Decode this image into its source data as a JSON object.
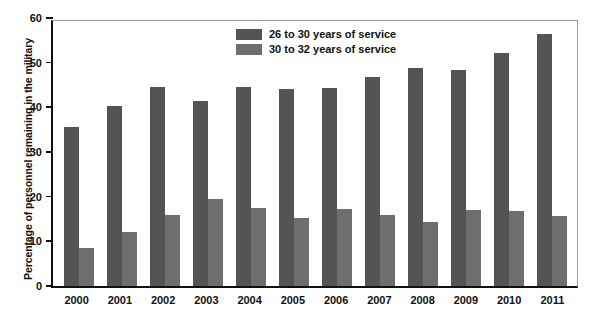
{
  "chart_data": {
    "type": "bar",
    "title": "",
    "xlabel": "",
    "ylabel": "Percentage of personnel remaining in the military",
    "ylim": [
      0,
      60
    ],
    "yticks": [
      0,
      10,
      20,
      30,
      40,
      50,
      60
    ],
    "grid": false,
    "legend_position": "top-center",
    "categories": [
      "2000",
      "2001",
      "2002",
      "2003",
      "2004",
      "2005",
      "2006",
      "2007",
      "2008",
      "2009",
      "2010",
      "2011"
    ],
    "series": [
      {
        "name": "26 to 30 years of service",
        "color": "#545454",
        "values": [
          35.5,
          40.4,
          44.5,
          41.4,
          44.5,
          44.0,
          44.3,
          46.9,
          48.9,
          48.3,
          52.2,
          56.5
        ]
      },
      {
        "name": "30 to 32 years of service",
        "color": "#6e6e6e",
        "values": [
          8.6,
          12.0,
          16.0,
          19.5,
          17.4,
          15.2,
          17.2,
          15.9,
          14.4,
          17.1,
          16.8,
          15.6
        ]
      }
    ]
  }
}
